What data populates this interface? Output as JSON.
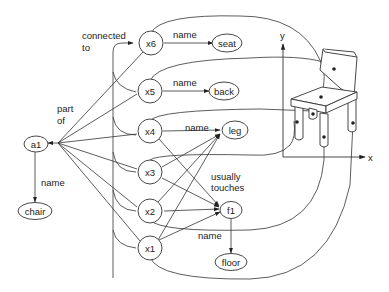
{
  "diagram": {
    "type": "semantic network with chair part grounding",
    "nodes": {
      "a1": {
        "label": "a1"
      },
      "chair": {
        "label": "chair"
      },
      "x1": {
        "label": "x1"
      },
      "x2": {
        "label": "x2"
      },
      "x3": {
        "label": "x3"
      },
      "x4": {
        "label": "x4"
      },
      "x5": {
        "label": "x5"
      },
      "x6": {
        "label": "x6"
      },
      "seat": {
        "label": "seat"
      },
      "back": {
        "label": "back"
      },
      "leg": {
        "label": "leg"
      },
      "f1": {
        "label": "f1"
      },
      "floor": {
        "label": "floor"
      }
    },
    "edge_labels": {
      "connected_to_line1": "connected",
      "connected_to_line2": "to",
      "part_of_line1": "part",
      "part_of_line2": "of",
      "a1_name": "name",
      "x6_name": "name",
      "x5_name": "name",
      "x4_name": "name",
      "usually_touches_line1": "usually",
      "usually_touches_line2": "touches",
      "f1_name": "name"
    },
    "axes": {
      "y_label": "y",
      "x_label": "x"
    },
    "edges": [
      {
        "from": "x1",
        "to": "a1",
        "label": "part of"
      },
      {
        "from": "x2",
        "to": "a1",
        "label": "part of"
      },
      {
        "from": "x3",
        "to": "a1",
        "label": "part of"
      },
      {
        "from": "x4",
        "to": "a1",
        "label": "part of"
      },
      {
        "from": "x5",
        "to": "a1",
        "label": "part of"
      },
      {
        "from": "x6",
        "to": "a1",
        "label": "part of"
      },
      {
        "from": "a1",
        "to": "chair",
        "label": "name"
      },
      {
        "from": "x6",
        "to": "seat",
        "label": "name"
      },
      {
        "from": "x5",
        "to": "back",
        "label": "name"
      },
      {
        "from": "x4",
        "to": "leg",
        "label": "name"
      },
      {
        "from": "x3",
        "to": "leg",
        "label": "name"
      },
      {
        "from": "x2",
        "to": "leg",
        "label": "name"
      },
      {
        "from": "x1",
        "to": "leg",
        "label": "name"
      },
      {
        "from": "x4",
        "to": "f1",
        "label": "usually touches"
      },
      {
        "from": "x3",
        "to": "f1",
        "label": "usually touches"
      },
      {
        "from": "x2",
        "to": "f1",
        "label": "usually touches"
      },
      {
        "from": "x1",
        "to": "f1",
        "label": "usually touches"
      },
      {
        "from": "f1",
        "to": "floor",
        "label": "name"
      },
      {
        "from": "x5",
        "to": "x6",
        "label": "connected to"
      },
      {
        "from": "x4",
        "to": "x6",
        "label": "connected to"
      },
      {
        "from": "x3",
        "to": "x6",
        "label": "connected to"
      },
      {
        "from": "x2",
        "to": "x6",
        "label": "connected to"
      },
      {
        "from": "x1",
        "to": "x6",
        "label": "connected to"
      }
    ]
  }
}
